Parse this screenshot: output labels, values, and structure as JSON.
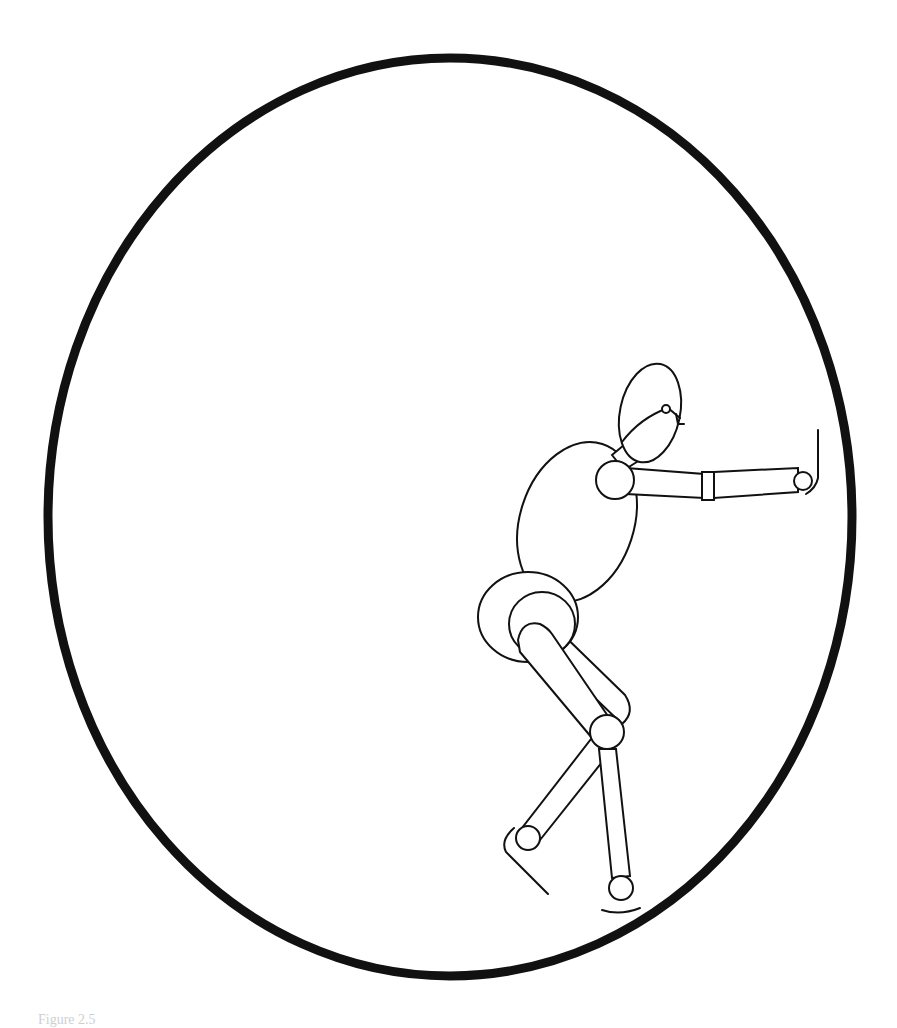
{
  "figure": {
    "caption_partial": "Figure 2.5",
    "colors": {
      "stroke": "#111111",
      "background": "#ffffff",
      "caption": "#cfcfcf"
    }
  }
}
